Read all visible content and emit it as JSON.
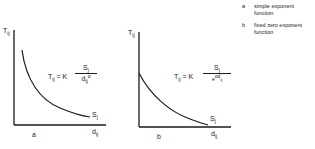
{
  "legend": [
    {
      "key": "a",
      "text": "simple exponent function"
    },
    {
      "key": "b",
      "text": "fixed zero exponent function"
    }
  ],
  "panels": [
    {
      "id": "a",
      "y_axis_label": {
        "main": "T",
        "sub": "ij"
      },
      "x_axis_label": {
        "main": "d",
        "sub": "ij"
      },
      "curve_label": {
        "main": "S",
        "sub": "j"
      },
      "formula": {
        "lhs_main": "T",
        "lhs_sub": "ij",
        "eq": " = K",
        "num_main": "S",
        "num_sub": "j",
        "den_main": "d",
        "den_sub": "ij",
        "den_sup": "α"
      },
      "panel_label": "a"
    },
    {
      "id": "b",
      "y_axis_label": {
        "main": "T",
        "sub": "ij"
      },
      "x_axis_label": {
        "main": "d",
        "sub": "ij"
      },
      "curve_label": {
        "main": "S",
        "sub": "j"
      },
      "formula": {
        "lhs_main": "T",
        "lhs_sub": "ij",
        "eq": " = K",
        "num_main": "S",
        "num_sub": "j",
        "den_main": "e",
        "den_sup": "αd",
        "den_sup_sub": "ij"
      },
      "panel_label": "b"
    }
  ]
}
